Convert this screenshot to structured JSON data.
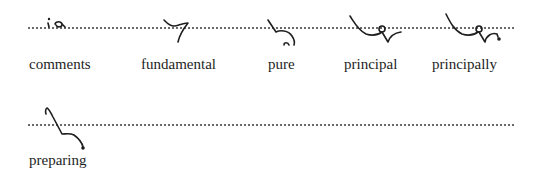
{
  "rows": [
    {
      "entries": [
        {
          "word": "comments"
        },
        {
          "word": "fundamental"
        },
        {
          "word": "pure"
        },
        {
          "word": "principal"
        },
        {
          "word": "principally"
        }
      ]
    },
    {
      "entries": [
        {
          "word": "preparing"
        }
      ]
    }
  ],
  "icons": {
    "outline_style": "shorthand-outline",
    "ink_color": "#1e1e1e",
    "baseline_color": "#6a6a6a"
  }
}
